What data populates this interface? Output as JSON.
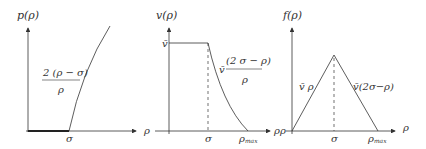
{
  "panels": [
    {
      "id": "pressure",
      "ylabel": "p(ρ)",
      "xtick": "σ",
      "formula_num": "2 (ρ − σ)",
      "formula_den": "ρ"
    },
    {
      "id": "velocity",
      "ylabel": "v(ρ)",
      "xlabel_left": "ρ",
      "xlabel_right": "ρ",
      "ytick": "v̄",
      "xtick_sigma": "σ",
      "xtick_max": "ρ",
      "xtick_max_sub": "max",
      "formula_prefix": "v̄",
      "formula_num": "(2 σ − ρ)",
      "formula_den": "ρ"
    },
    {
      "id": "flux",
      "ylabel": "f(ρ)",
      "xlabel_left": "ρ",
      "xlabel_right": "ρ",
      "xtick_sigma": "σ",
      "xtick_max": "ρ",
      "xtick_max_sub": "max",
      "left_label": "v̄ ρ",
      "right_label": "v̄(2σ−ρ)"
    }
  ],
  "colors": {
    "line": "#333333"
  }
}
